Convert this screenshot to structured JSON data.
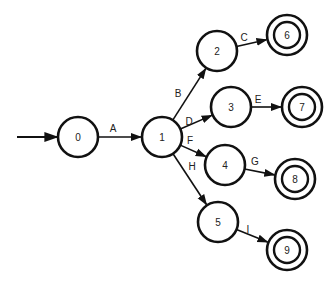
{
  "diagram": {
    "type": "state-machine",
    "start_state": "0",
    "states": [
      {
        "id": "0",
        "label": "0",
        "x": 78,
        "y": 137,
        "accepting": false
      },
      {
        "id": "1",
        "label": "1",
        "x": 162,
        "y": 137,
        "accepting": false
      },
      {
        "id": "2",
        "label": "2",
        "x": 217,
        "y": 51,
        "accepting": false
      },
      {
        "id": "3",
        "label": "3",
        "x": 231,
        "y": 107,
        "accepting": false
      },
      {
        "id": "4",
        "label": "4",
        "x": 225,
        "y": 165,
        "accepting": false
      },
      {
        "id": "5",
        "label": "5",
        "x": 218,
        "y": 222,
        "accepting": false
      },
      {
        "id": "6",
        "label": "6",
        "x": 287,
        "y": 35,
        "accepting": true
      },
      {
        "id": "7",
        "label": "7",
        "x": 302,
        "y": 107,
        "accepting": true
      },
      {
        "id": "8",
        "label": "8",
        "x": 295,
        "y": 179,
        "accepting": true
      },
      {
        "id": "9",
        "label": "9",
        "x": 287,
        "y": 250,
        "accepting": true
      }
    ],
    "transitions": [
      {
        "from": "0",
        "to": "1",
        "label": "A",
        "lx": 113,
        "ly": 132
      },
      {
        "from": "1",
        "to": "2",
        "label": "B",
        "lx": 178,
        "ly": 97
      },
      {
        "from": "2",
        "to": "6",
        "label": "C",
        "lx": 244,
        "ly": 41
      },
      {
        "from": "1",
        "to": "3",
        "label": "D",
        "lx": 189,
        "ly": 125
      },
      {
        "from": "3",
        "to": "7",
        "label": "E",
        "lx": 258,
        "ly": 103
      },
      {
        "from": "1",
        "to": "4",
        "label": "F",
        "lx": 190,
        "ly": 144
      },
      {
        "from": "4",
        "to": "8",
        "label": "G",
        "lx": 255,
        "ly": 165
      },
      {
        "from": "1",
        "to": "5",
        "label": "H",
        "lx": 192,
        "ly": 170
      },
      {
        "from": "5",
        "to": "9",
        "label": "I",
        "lx": 248,
        "ly": 233
      }
    ]
  }
}
